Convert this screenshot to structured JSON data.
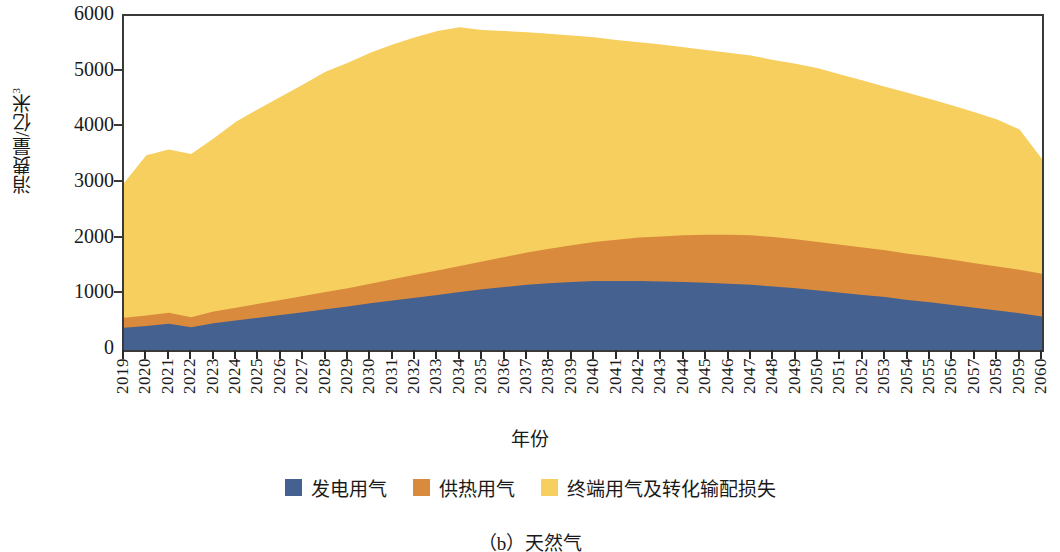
{
  "chart_data": {
    "type": "area",
    "stacked": true,
    "title": "",
    "caption": "（b）天然气",
    "xlabel": "年份",
    "ylabel": "消费量/亿米³",
    "ylabel_main": "消费量/亿米",
    "ylabel_sup": "3",
    "ylim": [
      0,
      6000
    ],
    "yticks": [
      0,
      1000,
      2000,
      3000,
      4000,
      5000,
      6000
    ],
    "ytick_labels": [
      "0",
      "1000",
      "2000",
      "3000",
      "4000",
      "5000",
      "6000"
    ],
    "grid": false,
    "legend_position": "bottom",
    "categories": [
      2019,
      2020,
      2021,
      2022,
      2023,
      2024,
      2025,
      2026,
      2027,
      2028,
      2029,
      2030,
      2031,
      2032,
      2033,
      2034,
      2035,
      2036,
      2037,
      2038,
      2039,
      2040,
      2041,
      2042,
      2043,
      2044,
      2045,
      2046,
      2047,
      2048,
      2049,
      2050,
      2051,
      2052,
      2053,
      2054,
      2055,
      2056,
      2057,
      2058,
      2059,
      2060
    ],
    "series": [
      {
        "name": "发电用气",
        "color": "#44618F",
        "values": [
          400,
          430,
          470,
          410,
          480,
          530,
          580,
          630,
          680,
          730,
          780,
          840,
          890,
          940,
          990,
          1040,
          1090,
          1130,
          1170,
          1200,
          1220,
          1240,
          1240,
          1240,
          1230,
          1220,
          1210,
          1190,
          1170,
          1140,
          1110,
          1070,
          1030,
          990,
          950,
          900,
          860,
          810,
          760,
          710,
          660,
          600
        ]
      },
      {
        "name": "供热用气",
        "color": "#D98A3C",
        "values": [
          180,
          190,
          200,
          180,
          210,
          230,
          250,
          270,
          290,
          310,
          330,
          350,
          380,
          410,
          440,
          470,
          500,
          540,
          580,
          620,
          660,
          700,
          740,
          780,
          810,
          840,
          860,
          880,
          890,
          890,
          880,
          870,
          860,
          850,
          840,
          830,
          820,
          810,
          800,
          790,
          780,
          770
        ]
      },
      {
        "name": "终端用气及转化输配损失",
        "color": "#F7CF5E",
        "values": [
          2420,
          2880,
          2930,
          2930,
          3110,
          3340,
          3500,
          3650,
          3800,
          3960,
          4050,
          4150,
          4220,
          4270,
          4300,
          4290,
          4160,
          4060,
          3960,
          3860,
          3770,
          3680,
          3590,
          3510,
          3450,
          3380,
          3320,
          3270,
          3230,
          3180,
          3150,
          3120,
          3060,
          3000,
          2940,
          2890,
          2830,
          2770,
          2710,
          2640,
          2520,
          2060
        ]
      }
    ],
    "totals": [
      3000,
      3500,
      3600,
      3520,
      3800,
      4100,
      4330,
      4550,
      4770,
      5000,
      5160,
      5340,
      5490,
      5620,
      5730,
      5800,
      5750,
      5730,
      5710,
      5680,
      5650,
      5620,
      5570,
      5530,
      5490,
      5440,
      5390,
      5340,
      5290,
      5210,
      5140,
      5060,
      4950,
      4840,
      4730,
      4620,
      4510,
      4390,
      4270,
      4140,
      3960,
      3430
    ]
  },
  "legend": {
    "items": [
      {
        "label": "发电用气",
        "color": "#44618F"
      },
      {
        "label": "供热用气",
        "color": "#D98A3C"
      },
      {
        "label": "终端用气及转化输配损失",
        "color": "#F7CF5E"
      }
    ]
  }
}
